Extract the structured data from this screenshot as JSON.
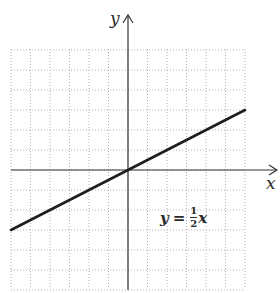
{
  "chart_data": {
    "type": "line",
    "title": "",
    "xlabel": "x",
    "ylabel": "y",
    "xlim": [
      -6,
      6
    ],
    "ylim": [
      -6,
      6
    ],
    "grid": true,
    "grid_style": "dotted",
    "series": [
      {
        "name": "y = 1/2 x",
        "equation": "y = (1/2)x",
        "x": [
          -6,
          6
        ],
        "y": [
          -3,
          3
        ]
      }
    ],
    "annotations": [
      {
        "text": "y = 1/2 x",
        "x": 2.5,
        "y": -3
      }
    ]
  },
  "labels": {
    "x_axis": "x",
    "y_axis": "y",
    "equation": {
      "lhs": "y",
      "eq": "=",
      "num": "1",
      "den": "2",
      "var": "x"
    }
  },
  "colors": {
    "grid": "#b0b0b0",
    "axis": "#333333",
    "line": "#1e1e1e"
  }
}
